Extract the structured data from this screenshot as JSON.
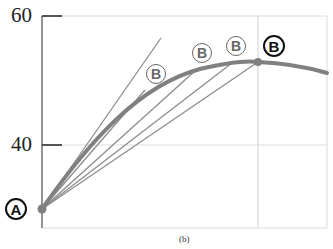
{
  "figure": {
    "caption": "(b)",
    "y_ticks": [
      {
        "label": "60",
        "value": 60
      },
      {
        "label": "40",
        "value": 40
      }
    ],
    "point_a": {
      "label": "A"
    },
    "point_b_labels": [
      {
        "label": "B",
        "style": "gray"
      },
      {
        "label": "B",
        "style": "gray"
      },
      {
        "label": "B",
        "style": "gray"
      },
      {
        "label": "B",
        "style": "black"
      }
    ],
    "colors": {
      "curve": "#808080",
      "lines": "#8c8c8c",
      "axis": "#707070",
      "grid": "#d0d0d0"
    }
  }
}
